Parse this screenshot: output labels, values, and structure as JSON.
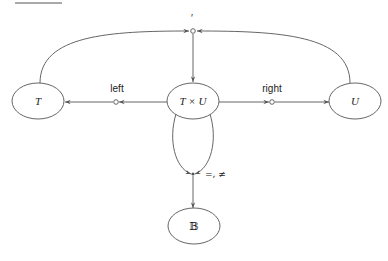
{
  "diagram": {
    "type": "type-signature graph",
    "nodes": [
      {
        "id": "T",
        "label": "T"
      },
      {
        "id": "TxU",
        "label": "T × U"
      },
      {
        "id": "U",
        "label": "U"
      },
      {
        "id": "B",
        "label": "𝔹"
      }
    ],
    "operations": [
      {
        "id": "pair",
        "label": "′",
        "inputs": [
          "T",
          "U"
        ],
        "output": "TxU"
      },
      {
        "id": "left",
        "label": "left",
        "inputs": [
          "TxU"
        ],
        "output": "T"
      },
      {
        "id": "right",
        "label": "right",
        "inputs": [
          "TxU"
        ],
        "output": "U"
      },
      {
        "id": "eq",
        "label": "=, ≠",
        "inputs": [
          "TxU",
          "TxU"
        ],
        "output": "B"
      }
    ]
  },
  "colors": {
    "stroke": "#555555",
    "text": "#222222",
    "background": "#ffffff"
  }
}
